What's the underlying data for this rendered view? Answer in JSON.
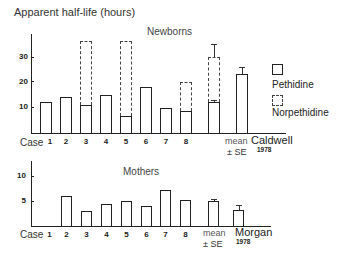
{
  "figure": {
    "ylabel": "Apparent half-life (hours)",
    "legend": {
      "pethidine": "Pethidine",
      "norpethidine": "Norpethidine"
    },
    "mean_label": "mean",
    "se_label": "± SE",
    "case_label": "Case",
    "top": {
      "title": "Newborns",
      "ref_name": "Caldwell",
      "ref_year": "1978",
      "ticks": [
        "10",
        "20",
        "30"
      ]
    },
    "bottom": {
      "title": "Mothers",
      "ref_name": "Morgan",
      "ref_year": "1978",
      "ticks": [
        "5",
        "10"
      ]
    },
    "x_labels": [
      "1",
      "2",
      "3",
      "4",
      "5",
      "6",
      "7",
      "8"
    ]
  },
  "chart_data": [
    {
      "type": "bar",
      "title": "Newborns",
      "ylabel": "Apparent half-life (hours)",
      "categories": [
        "Case 1",
        "2",
        "3",
        "4",
        "5",
        "6",
        "7",
        "8",
        "mean ± SE",
        "Caldwell 1978"
      ],
      "series": [
        {
          "name": "Pethidine",
          "style": "solid",
          "values": [
            12,
            14,
            11,
            15,
            6.5,
            18,
            10,
            8.5,
            12,
            23
          ]
        },
        {
          "name": "Norpethidine",
          "style": "dashed",
          "values": [
            null,
            null,
            36,
            null,
            36,
            null,
            null,
            20,
            30,
            null
          ]
        }
      ],
      "error_bars": {
        "mean ± SE": {
          "Pethidine": 1,
          "Norpethidine": 5
        },
        "Caldwell 1978": {
          "Pethidine": 3
        }
      },
      "yticks": [
        10,
        20,
        30
      ],
      "ylim": [
        0,
        40
      ],
      "legend_position": "right"
    },
    {
      "type": "bar",
      "title": "Mothers",
      "categories": [
        "Case 1",
        "2",
        "3",
        "4",
        "5",
        "6",
        "7",
        "8",
        "mean ± SE",
        "Morgan 1978"
      ],
      "series": [
        {
          "name": "Pethidine",
          "style": "solid",
          "values": [
            null,
            6,
            3,
            4.5,
            5,
            4,
            7.2,
            5.3,
            5,
            3.3
          ]
        }
      ],
      "error_bars": {
        "mean ± SE": {
          "Pethidine": 0.5
        },
        "Morgan 1978": {
          "Pethidine": 1
        }
      },
      "yticks": [
        5,
        10
      ],
      "ylim": [
        0,
        12
      ]
    }
  ]
}
